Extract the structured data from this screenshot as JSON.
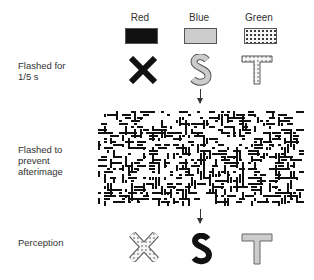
{
  "columns": [
    {
      "label": "Red",
      "swatch_color": "#111111",
      "swatch_pattern": "solid"
    },
    {
      "label": "Blue",
      "swatch_color": "#cccccc",
      "swatch_pattern": "solid"
    },
    {
      "label": "Green",
      "swatch_color": "#f4f4f4",
      "swatch_pattern": "dotted"
    }
  ],
  "rows": [
    {
      "label": "Flashed for 1/5 s",
      "letters": [
        "X",
        "S",
        "T"
      ],
      "letter_styles": [
        "red-solid",
        "blue-gray",
        "green-dotted"
      ]
    },
    {
      "label": "Flashed to prevent afterimage",
      "content": "random-line-noise-mask"
    },
    {
      "label": "Perception",
      "letters": [
        "X",
        "S",
        "T"
      ],
      "letter_styles": [
        "green-dotted",
        "red-solid",
        "blue-gray"
      ]
    }
  ],
  "labels": {
    "row1_line1": "Flashed for",
    "row1_line2": "1/5 s",
    "row2_line1": "Flashed to",
    "row2_line2": "prevent",
    "row2_line3": "afterimage",
    "row3": "Perception"
  },
  "colors": {
    "red": "#111111",
    "blue": "#cccccc",
    "green": "#f4f4f4"
  }
}
